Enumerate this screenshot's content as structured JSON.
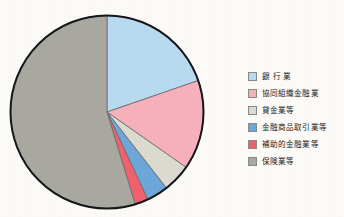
{
  "chart_data": {
    "type": "pie",
    "title": "",
    "subtitle": "",
    "xlabel": "",
    "ylabel": "",
    "legend_position": "right",
    "start_angle_deg": 0,
    "direction": "clockwise",
    "categories": [
      "銀 行 業",
      "協同組織金融業",
      "貸金業等",
      "金融商品取引業等",
      "補助的金融業等",
      "保険業等"
    ],
    "values": [
      19.7,
      15.0,
      4.7,
      3.6,
      2.2,
      54.8
    ],
    "colors": [
      "#b9dcf1",
      "#f8b2bd",
      "#dddcd3",
      "#6ea7da",
      "#f4616d",
      "#a9a9a1"
    ],
    "slices": [
      {
        "label": "銀 行 業",
        "value": 19.7,
        "angle_deg": 71,
        "color": "#b9dcf1"
      },
      {
        "label": "協同組織金融業",
        "value": 15.0,
        "angle_deg": 54,
        "color": "#f8b2bd"
      },
      {
        "label": "貸金業等",
        "value": 4.7,
        "angle_deg": 17,
        "color": "#dddcd3"
      },
      {
        "label": "金融商品取引業等",
        "value": 3.6,
        "angle_deg": 13,
        "color": "#6ea7da"
      },
      {
        "label": "補助的金融業等",
        "value": 2.2,
        "angle_deg": 8,
        "color": "#f4616d"
      },
      {
        "label": "保険業等",
        "value": 54.8,
        "angle_deg": 197,
        "color": "#a9a9a1"
      }
    ]
  },
  "legend": {
    "items": [
      {
        "label": "銀 行 業",
        "color": "#b9dcf1"
      },
      {
        "label": "協同組織金融業",
        "color": "#f8b2bd"
      },
      {
        "label": "貸金業等",
        "color": "#dddcd3"
      },
      {
        "label": "金融商品取引業等",
        "color": "#6ea7da"
      },
      {
        "label": "補助的金融業等",
        "color": "#f4616d"
      },
      {
        "label": "保険業等",
        "color": "#a9a9a1"
      }
    ]
  },
  "style": {
    "background": "#fdfcf9",
    "outline": "#17171b",
    "separator": "#6f6f72"
  }
}
